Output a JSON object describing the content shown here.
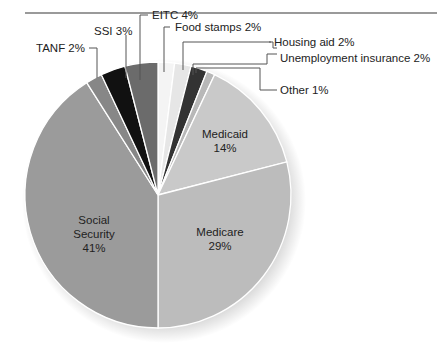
{
  "chart_data": {
    "type": "pie",
    "title": "",
    "start_angle_deg": 0,
    "direction": "clockwise",
    "slices": [
      {
        "label": "Food stamps",
        "value": 2,
        "display": "Food stamps 2%",
        "color": "#f4f4f4",
        "label_position": "outside"
      },
      {
        "label": "Housing aid",
        "value": 2,
        "display": "Housing aid 2%",
        "color": "#e6e6e6",
        "label_position": "outside"
      },
      {
        "label": "Unemployment insurance",
        "value": 2,
        "display": "Unemployment insurance 2%",
        "color": "#333333",
        "label_position": "outside"
      },
      {
        "label": "Other",
        "value": 1,
        "display": "Other 1%",
        "color": "#b8b8b8",
        "label_position": "outside"
      },
      {
        "label": "Medicaid",
        "value": 14,
        "display": "Medicaid 14%",
        "color": "#c9c9c9",
        "label_position": "inside"
      },
      {
        "label": "Medicare",
        "value": 29,
        "display": "Medicare 29%",
        "color": "#bcbcbc",
        "label_position": "inside"
      },
      {
        "label": "Social Security",
        "value": 41,
        "display": "Social Security 41%",
        "color": "#9b9b9b",
        "label_position": "inside"
      },
      {
        "label": "TANF",
        "value": 2,
        "display": "TANF 2%",
        "color": "#878787",
        "label_position": "outside"
      },
      {
        "label": "SSI",
        "value": 3,
        "display": "SSI 3%",
        "color": "#111111",
        "label_position": "outside"
      },
      {
        "label": "EITC",
        "value": 4,
        "display": "EITC 4%",
        "color": "#6b6b6b",
        "label_position": "outside"
      }
    ],
    "units": "%",
    "legend": "none (direct labels with leader lines)"
  },
  "labels": {
    "food_stamps": "Food stamps 2%",
    "housing_aid": "Housing aid 2%",
    "unemployment": "Unemployment insurance 2%",
    "other": "Other 1%",
    "tanf": "TANF 2%",
    "ssi": "SSI 3%",
    "eitc": "EITC 4%",
    "medicaid_name": "Medicaid",
    "medicaid_pct": "14%",
    "medicare_name": "Medicare",
    "medicare_pct": "29%",
    "ss_name1": "Social",
    "ss_name2": "Security",
    "ss_pct": "41%"
  }
}
